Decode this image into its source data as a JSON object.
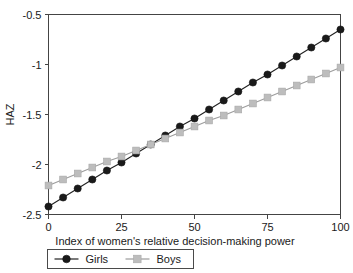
{
  "chart_data": {
    "type": "line",
    "title": "",
    "xlabel": "Index of women's relative decision-making power",
    "ylabel": "HAZ",
    "xlim": [
      0,
      100
    ],
    "ylim": [
      -2.5,
      -0.5
    ],
    "grid": false,
    "legend_position": "bottom",
    "xticks": [
      "0",
      "25",
      "50",
      "75",
      "100"
    ],
    "xtick_values": [
      0,
      25,
      50,
      75,
      100
    ],
    "yticks": [
      "-0.5",
      "-1",
      "-1.5",
      "-2",
      "-2.5"
    ],
    "ytick_values": [
      -0.5,
      -1,
      -1.5,
      -2,
      -2.5
    ],
    "x": [
      0,
      5,
      10,
      15,
      20,
      25,
      30,
      35,
      40,
      45,
      50,
      55,
      60,
      65,
      70,
      75,
      80,
      85,
      90,
      95,
      100
    ],
    "series": [
      {
        "name": "Girls",
        "color": "#1a1a1a",
        "marker": "circle",
        "values": [
          -2.42,
          -2.33,
          -2.24,
          -2.15,
          -2.06,
          -1.98,
          -1.89,
          -1.8,
          -1.71,
          -1.62,
          -1.54,
          -1.45,
          -1.36,
          -1.27,
          -1.18,
          -1.1,
          -1.01,
          -0.92,
          -0.83,
          -0.74,
          -0.65
        ]
      },
      {
        "name": "Boys",
        "color": "#bdbdbd",
        "marker": "square",
        "values": [
          -2.21,
          -2.15,
          -2.09,
          -2.03,
          -1.97,
          -1.92,
          -1.86,
          -1.8,
          -1.74,
          -1.68,
          -1.62,
          -1.56,
          -1.51,
          -1.45,
          -1.39,
          -1.33,
          -1.27,
          -1.21,
          -1.15,
          -1.09,
          -1.03
        ]
      }
    ]
  },
  "legend": {
    "entries": [
      {
        "label": "Girls",
        "marker": "circle-marker",
        "color": "#1a1a1a"
      },
      {
        "label": "Boys",
        "marker": "square-marker",
        "color": "#bdbdbd"
      }
    ]
  }
}
